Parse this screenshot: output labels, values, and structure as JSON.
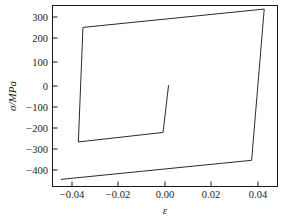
{
  "chart_data": {
    "type": "line",
    "title": "",
    "xlabel": "ε",
    "ylabel": "σ/MPa",
    "xlim": [
      -0.0505,
      0.0478
    ],
    "ylim": [
      -430,
      330
    ],
    "grid": false,
    "legend": null,
    "xticks": [
      -0.04,
      -0.02,
      0.0,
      0.02,
      0.04
    ],
    "xticklabels": [
      "−0.04",
      "−0.02",
      "0.00",
      "0.02",
      "0.04"
    ],
    "yticks": [
      300,
      200,
      100,
      0,
      -100,
      -200,
      -300,
      -400
    ],
    "yticklabels": [
      "300",
      "200",
      "100",
      "0",
      "−100",
      "−200",
      "−300",
      "−400"
    ],
    "series": [
      {
        "name": "hysteresis-loop",
        "color": "#2a2a2a",
        "points": [
          [
            -0.0468,
            -400
          ],
          [
            0.0365,
            -320
          ],
          [
            0.042,
            315
          ],
          [
            -0.0372,
            238
          ],
          [
            -0.0392,
            -243
          ],
          [
            -0.0022,
            -203
          ],
          [
            0.0002,
            -5
          ]
        ]
      }
    ],
    "annotations": []
  },
  "figure": {
    "axis_label_x": "ε",
    "axis_label_y": "σ/MPa"
  }
}
